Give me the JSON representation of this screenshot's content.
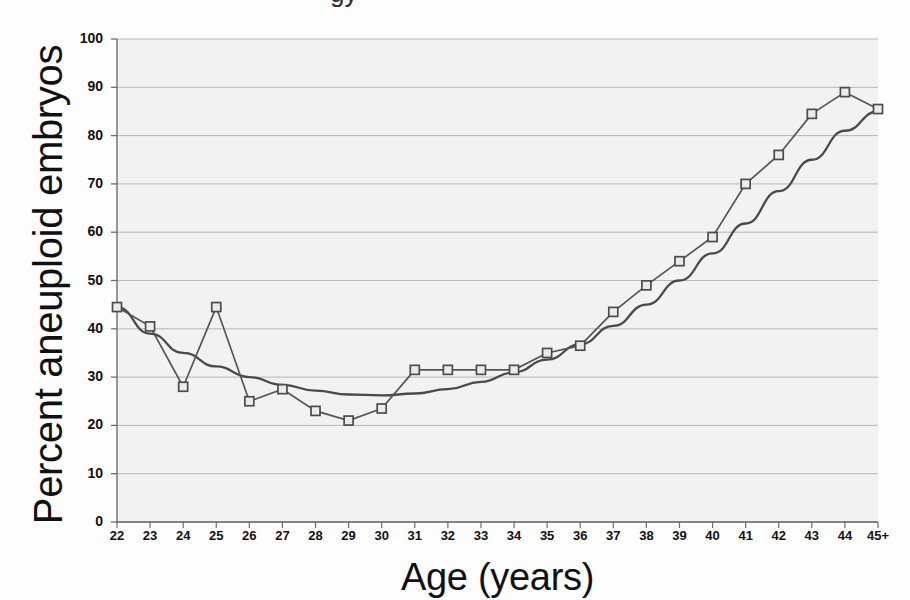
{
  "chart_data": {
    "type": "line",
    "title": "",
    "xlabel": "Age (years)",
    "ylabel": "Percent aneuploid embryos",
    "categories": [
      "22",
      "23",
      "24",
      "25",
      "26",
      "27",
      "28",
      "29",
      "30",
      "31",
      "32",
      "33",
      "34",
      "35",
      "36",
      "37",
      "38",
      "39",
      "40",
      "41",
      "42",
      "43",
      "44",
      "45+"
    ],
    "xlim": [
      22,
      45
    ],
    "ylim": [
      0,
      100
    ],
    "yticks": [
      "0",
      "10",
      "20",
      "30",
      "40",
      "50",
      "60",
      "70",
      "80",
      "90",
      "100"
    ],
    "xticks": [
      "22",
      "23",
      "24",
      "25",
      "26",
      "27",
      "28",
      "29",
      "30",
      "31",
      "32",
      "33",
      "34",
      "35",
      "36",
      "37",
      "38",
      "39",
      "40",
      "41",
      "42",
      "43",
      "44",
      "45+"
    ],
    "grid": "horizontal",
    "legend": "none",
    "series": [
      {
        "name": "Percent aneuploid embryos",
        "marker": "open-square",
        "color": "#555555",
        "values": [
          44.5,
          40.5,
          28.0,
          44.5,
          25.0,
          27.5,
          23.0,
          21.0,
          23.5,
          31.5,
          31.5,
          31.5,
          31.5,
          35.0,
          36.5,
          43.5,
          49.0,
          54.0,
          59.0,
          70.0,
          76.0,
          84.5,
          89.0,
          85.5
        ]
      },
      {
        "name": "Trendline (polynomial fit)",
        "marker": "none",
        "color": "#4a4a4a",
        "values": [
          44.5,
          39.0,
          35.0,
          32.2,
          30.0,
          28.4,
          27.2,
          26.4,
          26.2,
          26.6,
          27.5,
          29.0,
          31.0,
          33.6,
          36.8,
          40.6,
          45.0,
          50.0,
          55.6,
          61.8,
          68.5,
          75.0,
          81.0,
          85.0
        ]
      }
    ],
    "annotations": []
  },
  "style": {
    "plot_background": "#f2f2f2",
    "gridline_color": "#9a9aa0",
    "axis_color": "#6d6d6d",
    "marker_fill": "#ebebeb",
    "marker_edge": "#4c4c4c",
    "text_color": "#111111"
  },
  "cropped_top_text": "gy"
}
